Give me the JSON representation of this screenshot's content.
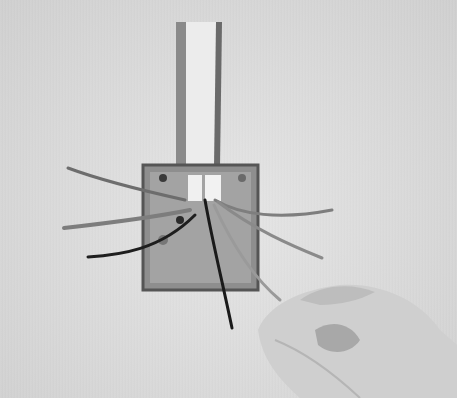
{
  "image": {
    "description": "Black and white photo of an open metal electrical back box mounted in a wall with conduit chase above; multiple wires protrude from the box and a hand pulls one wire to the lower right",
    "colors": {
      "wall": "#dcdcdc",
      "box_metal": "#9a9a9a",
      "box_edge": "#5a5a5a",
      "conduit": "#e8e8e8",
      "wire_dark": "#1e1e1e",
      "wire_light": "#8c8c8c",
      "skin": "#c8c8c8"
    }
  }
}
